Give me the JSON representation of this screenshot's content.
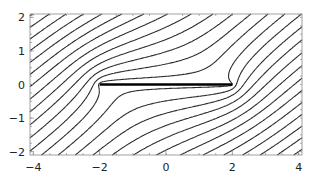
{
  "chart_data": {
    "type": "line",
    "title": "",
    "xlabel": "",
    "ylabel": "",
    "xlim": [
      -4.1,
      4.1
    ],
    "ylim": [
      -2.1,
      2.1
    ],
    "grid": false,
    "x_ticks": [
      {
        "value": -4,
        "label": "-4"
      },
      {
        "value": -2,
        "label": "-2"
      },
      {
        "value": 0,
        "label": "0"
      },
      {
        "value": 2,
        "label": "2"
      },
      {
        "value": 4,
        "label": "4"
      }
    ],
    "y_ticks": [
      {
        "value": 2,
        "label": "2"
      },
      {
        "value": 1,
        "label": "1"
      },
      {
        "value": 0,
        "label": "0"
      },
      {
        "value": -1,
        "label": "-1"
      },
      {
        "value": -2,
        "label": "-2"
      }
    ],
    "plate": {
      "x_start": -2,
      "x_end": 2,
      "y": 0
    },
    "flow_angle_deg": 35,
    "plate_half_length": 2,
    "stream_levels": {
      "min": -4.0,
      "max": 4.0,
      "step": 0.3
    },
    "line_color": "#2a2a2a",
    "plate_color": "#000000"
  }
}
